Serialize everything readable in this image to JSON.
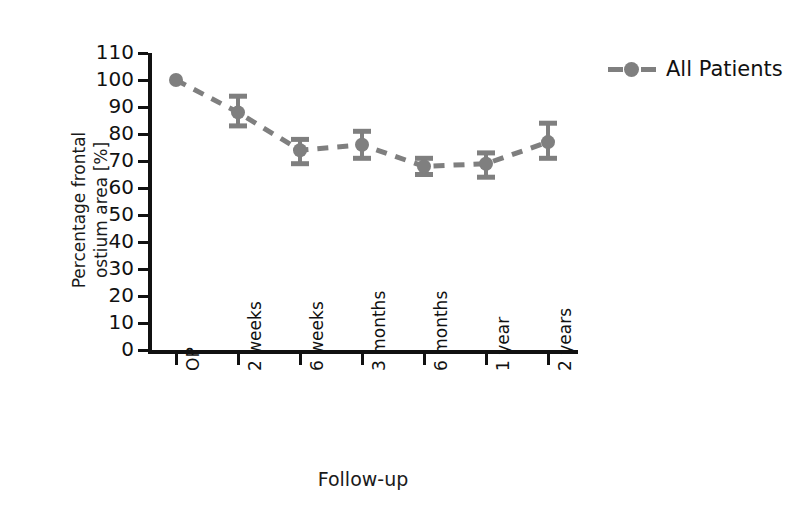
{
  "chart_data": {
    "type": "line",
    "title": "",
    "xlabel": "Follow-up",
    "ylabel_line1": "Percentage frontal",
    "ylabel_line2": "ostium area [%]",
    "categories": [
      "OP",
      "2 weeks",
      "6 weeks",
      "3 months",
      "6 months",
      "1 year",
      "2 years"
    ],
    "series": [
      {
        "name": "All Patients",
        "values": [
          100,
          88,
          74,
          76,
          68,
          69,
          77
        ],
        "err_low": [
          0,
          5,
          5,
          5,
          3,
          5,
          6
        ],
        "err_high": [
          0,
          6,
          4,
          5,
          3,
          4,
          7
        ],
        "color": "#7f7f7f",
        "linestyle": "dashed",
        "marker": "circle"
      }
    ],
    "ylim": [
      0,
      110
    ],
    "yticks": [
      0,
      10,
      20,
      30,
      40,
      50,
      60,
      70,
      80,
      90,
      100,
      110
    ],
    "ytick_labels": [
      "0",
      "10",
      "20",
      "30",
      "40",
      "50",
      "60",
      "70",
      "80",
      "90",
      "100",
      "110"
    ],
    "grid": false,
    "legend_position": "upper right"
  },
  "legend": {
    "entries": [
      {
        "label": "All Patients",
        "color": "#7f7f7f"
      }
    ]
  },
  "axis": {
    "x_title": "Follow-up",
    "y_title_line1": "Percentage frontal",
    "y_title_line2": "ostium area [%]"
  },
  "colors": {
    "series": "#7f7f7f",
    "axis": "#111111",
    "text": "#1a1a1a",
    "background": "#ffffff"
  }
}
